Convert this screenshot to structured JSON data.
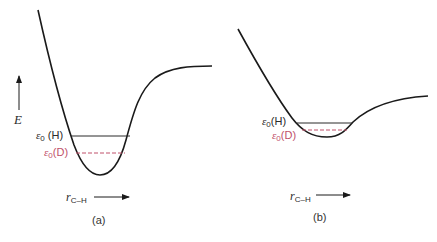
{
  "figure": {
    "panels": [
      {
        "id": "a",
        "caption": "(a)",
        "y_axis_label": "E",
        "x_axis_label_main": "r",
        "x_axis_label_sub": "C–H",
        "levels": [
          {
            "name": "H",
            "symbol": "ε",
            "sub": "0",
            "label": "(H)",
            "style": "solid",
            "color": "#2b2b2b"
          },
          {
            "name": "D",
            "symbol": "ε",
            "sub": "0",
            "label": "(D)",
            "style": "dashed",
            "color": "#c0506a"
          }
        ],
        "description": "Deep, narrow potential well for C–H bond"
      },
      {
        "id": "b",
        "caption": "(b)",
        "x_axis_label_main": "r",
        "x_axis_label_sub": "C–H",
        "levels": [
          {
            "name": "H",
            "symbol": "ε",
            "sub": "0",
            "label": "(H)",
            "style": "solid",
            "color": "#2b2b2b"
          },
          {
            "name": "D",
            "symbol": "ε",
            "sub": "0",
            "label": "(D)",
            "style": "dashed",
            "color": "#c0506a"
          }
        ],
        "description": "Shallow, broad potential well for C–H bond"
      }
    ],
    "colors": {
      "curve": "#1a1a1a",
      "h_level": "#2b2b2b",
      "d_level": "#c0506a",
      "background": "#ffffff"
    }
  }
}
